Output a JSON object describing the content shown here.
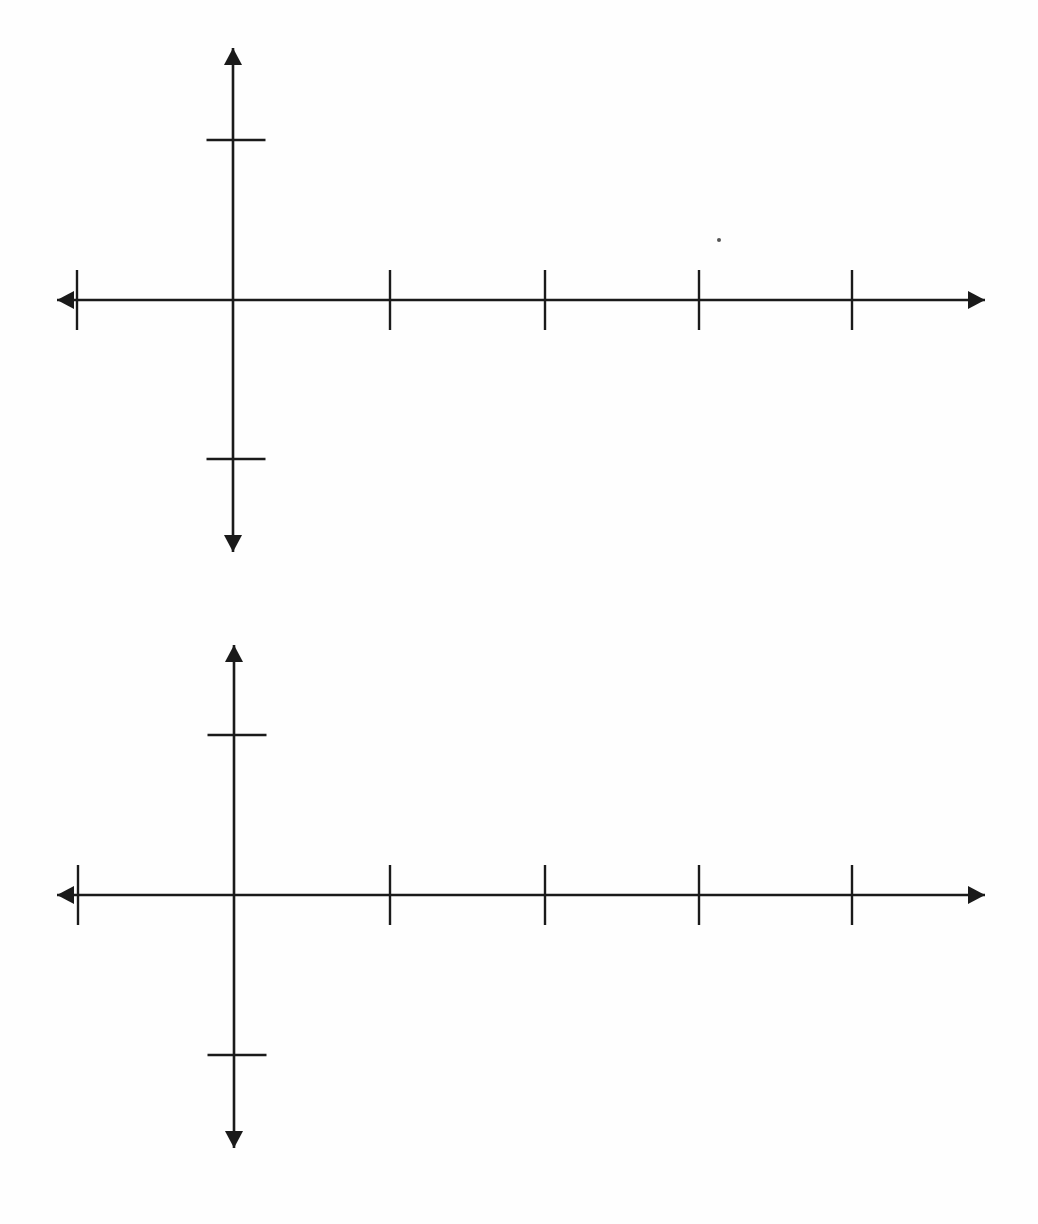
{
  "document": {
    "title": "Blank Coordinate Axes Worksheet",
    "page_background": "#fefefe",
    "ink_color": "#1a1a1a",
    "width": 1038,
    "height": 1224,
    "graph_count": 2
  },
  "graphs": [
    {
      "id": "graph-1",
      "name": "upper-blank-axes",
      "origin": {
        "x": 233,
        "y": 300
      },
      "x_axis": {
        "start_x": 57,
        "end_x": 985,
        "y": 300,
        "left_arrow": true,
        "right_arrow": true,
        "tick_length": 60,
        "ticks_x": [
          77,
          390,
          545,
          699,
          852
        ],
        "tick_labels": []
      },
      "y_axis": {
        "x": 233,
        "start_y": 48,
        "end_y": 552,
        "up_arrow": true,
        "down_arrow": true,
        "tick_length": 59,
        "ticks_y": [
          140,
          459
        ],
        "tick_labels": []
      },
      "artifacts": [
        {
          "name": "scan-speck",
          "x": 719,
          "y": 240,
          "r": 2
        }
      ]
    },
    {
      "id": "graph-2",
      "name": "lower-blank-axes",
      "origin": {
        "x": 234,
        "y": 895
      },
      "x_axis": {
        "start_x": 57,
        "end_x": 985,
        "y": 895,
        "left_arrow": true,
        "right_arrow": true,
        "tick_length": 60,
        "ticks_x": [
          78,
          390,
          545,
          699,
          852
        ],
        "tick_labels": []
      },
      "y_axis": {
        "x": 234,
        "start_y": 645,
        "end_y": 1148,
        "up_arrow": true,
        "down_arrow": true,
        "tick_length": 59,
        "ticks_y": [
          735,
          1055
        ],
        "tick_labels": []
      },
      "artifacts": []
    }
  ],
  "chart_data": [
    {
      "type": "scatter",
      "title": "",
      "subtitle": "",
      "xlabel": "",
      "ylabel": "",
      "series": [],
      "x": [],
      "values": [],
      "categories": [],
      "annotations": [],
      "legend": [],
      "grid": false,
      "xlim": [
        -1,
        4
      ],
      "ylim": [
        -1,
        1
      ],
      "xticks": [
        -1,
        1,
        2,
        3,
        4
      ],
      "yticks": [
        -1,
        1
      ],
      "xticklabels": [],
      "yticklabels": [],
      "notes": "Empty first-and-four-quadrant coordinate axes: no plotted data, no tick number labels."
    },
    {
      "type": "scatter",
      "title": "",
      "subtitle": "",
      "xlabel": "",
      "ylabel": "",
      "series": [],
      "x": [],
      "values": [],
      "categories": [],
      "annotations": [],
      "legend": [],
      "grid": false,
      "xlim": [
        -1,
        4
      ],
      "ylim": [
        -1,
        1
      ],
      "xticks": [
        -1,
        1,
        2,
        3,
        4
      ],
      "yticks": [
        -1,
        1
      ],
      "xticklabels": [],
      "yticklabels": [],
      "notes": "Second identical blank coordinate axes, duplicate of the first."
    }
  ]
}
